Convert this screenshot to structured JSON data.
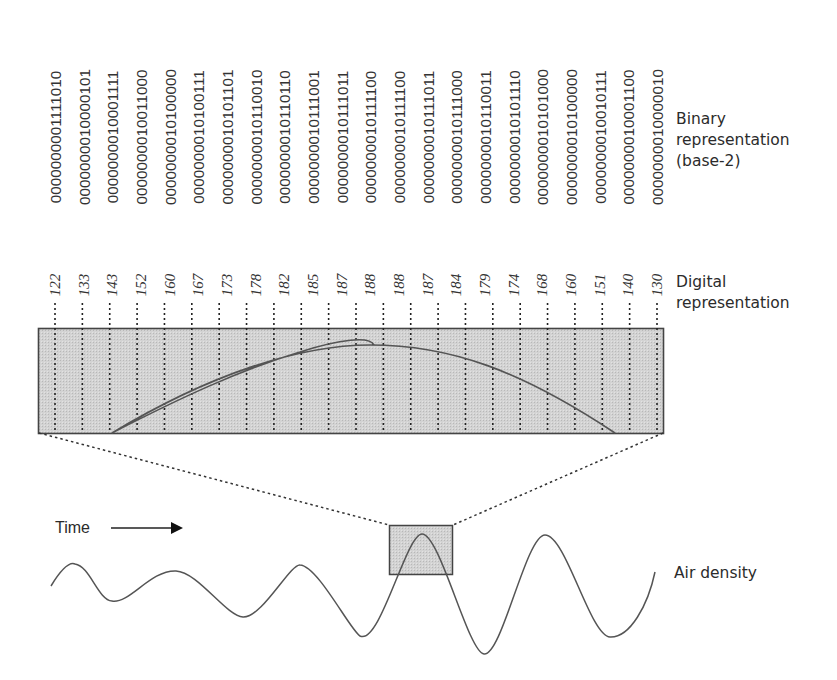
{
  "diagram": {
    "labels": {
      "binary": [
        "Binary",
        "representation",
        "(base-2)"
      ],
      "digital": [
        "Digital",
        "representation"
      ],
      "air_density": "Air density",
      "time": "Time"
    },
    "samples": [
      {
        "digital": "122",
        "binary": "0000000001111010"
      },
      {
        "digital": "133",
        "binary": "0000000010000101"
      },
      {
        "digital": "143",
        "binary": "0000000010001111"
      },
      {
        "digital": "152",
        "binary": "0000000010011000"
      },
      {
        "digital": "160",
        "binary": "0000000010100000"
      },
      {
        "digital": "167",
        "binary": "0000000010100111"
      },
      {
        "digital": "173",
        "binary": "0000000010101101"
      },
      {
        "digital": "178",
        "binary": "0000000010110010"
      },
      {
        "digital": "182",
        "binary": "0000000010110110"
      },
      {
        "digital": "185",
        "binary": "0000000010111001"
      },
      {
        "digital": "187",
        "binary": "0000000010111011"
      },
      {
        "digital": "188",
        "binary": "0000000010111100"
      },
      {
        "digital": "188",
        "binary": "0000000010111100"
      },
      {
        "digital": "187",
        "binary": "0000000010111011"
      },
      {
        "digital": "184",
        "binary": "0000000010111000"
      },
      {
        "digital": "179",
        "binary": "0000000010110011"
      },
      {
        "digital": "174",
        "binary": "0000000010101110"
      },
      {
        "digital": "168",
        "binary": "0000000010101000"
      },
      {
        "digital": "160",
        "binary": "0000000010100000"
      },
      {
        "digital": "151",
        "binary": "0000000010010111"
      },
      {
        "digital": "140",
        "binary": "0000000010001100"
      },
      {
        "digital": "130",
        "binary": "0000000010000010"
      }
    ],
    "colors": {
      "box_fill": "#cfcfcf",
      "box_stroke": "#444444",
      "curve": "#555555",
      "text": "#2b2b2b"
    }
  }
}
